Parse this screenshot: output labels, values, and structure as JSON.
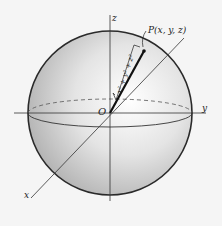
{
  "diagram": {
    "type": "sphere-coordinate-figure",
    "axes": {
      "x_label": "x",
      "y_label": "y",
      "z_label": "z"
    },
    "origin_label": "O",
    "point_label": "P(x, y, z)",
    "vector_label": "√(x² + y² + z²)",
    "vector_label_text": "x² + y² + z²",
    "colors": {
      "background": "#f5f5f5",
      "outline": "#2a2a2a",
      "sphere_light": "#ffffff",
      "sphere_dark": "#9a9a9a"
    }
  }
}
